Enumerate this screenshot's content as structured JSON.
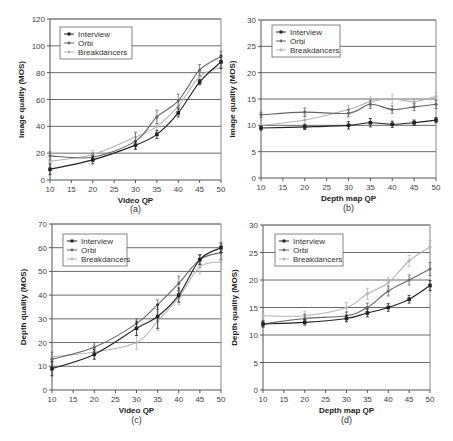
{
  "chart_data": [
    {
      "id": "a",
      "type": "line",
      "caption": "(a)",
      "xlabel": "Video QP",
      "ylabel": "Image quality (MOS)",
      "xlim": [
        10,
        50
      ],
      "ylim": [
        0,
        120
      ],
      "xticks": [
        10,
        15,
        20,
        25,
        30,
        35,
        40,
        45,
        50
      ],
      "yticks": [
        0,
        20,
        40,
        60,
        80,
        100,
        120
      ],
      "grid": "horizontal",
      "legend_position": "upper-left",
      "x": [
        10,
        20,
        30,
        35,
        40,
        45,
        50
      ],
      "series": [
        {
          "name": "Interview",
          "color": "#222222",
          "values": [
            8,
            15,
            26,
            34,
            50,
            73,
            88
          ],
          "errors": [
            4,
            3,
            3,
            3,
            3,
            2,
            5
          ]
        },
        {
          "name": "Orbi",
          "color": "#666666",
          "values": [
            18,
            17,
            29,
            47,
            59,
            82,
            92
          ],
          "errors": [
            3,
            3,
            6,
            5,
            5,
            4,
            4
          ]
        },
        {
          "name": "Breakdancers",
          "color": "#b5b5b5",
          "values": [
            14,
            19,
            32,
            40,
            55,
            77,
            84
          ],
          "errors": [
            4,
            3,
            4,
            6,
            5,
            4,
            4
          ]
        }
      ]
    },
    {
      "id": "b",
      "type": "line",
      "caption": "(b)",
      "xlabel": "Depth map QP",
      "ylabel": "Image quality (MOS)",
      "xlim": [
        10,
        50
      ],
      "ylim": [
        0,
        30
      ],
      "xticks": [
        10,
        15,
        20,
        25,
        30,
        35,
        40,
        45,
        50
      ],
      "yticks": [
        0,
        5,
        10,
        15,
        20,
        25,
        30
      ],
      "grid": "horizontal",
      "legend_position": "upper-left",
      "x": [
        10,
        20,
        30,
        35,
        40,
        45,
        50
      ],
      "series": [
        {
          "name": "Interview",
          "color": "#222222",
          "values": [
            9.5,
            9.7,
            10,
            10.5,
            10.2,
            10.5,
            11
          ],
          "errors": [
            0.4,
            0.5,
            0.7,
            0.8,
            0.6,
            0.5,
            0.5
          ]
        },
        {
          "name": "Orbi",
          "color": "#666666",
          "values": [
            12,
            12.5,
            12.3,
            14,
            13,
            13.5,
            14
          ],
          "errors": [
            0.5,
            0.8,
            0.7,
            0.8,
            0.7,
            0.7,
            0.8
          ]
        },
        {
          "name": "Breakdancers",
          "color": "#b5b5b5",
          "values": [
            10,
            11,
            13,
            14.5,
            15,
            14.5,
            15.5
          ],
          "errors": [
            0.5,
            0.8,
            0.8,
            0.9,
            0.9,
            0.6,
            0.7
          ]
        }
      ]
    },
    {
      "id": "c",
      "type": "line",
      "caption": "(c)",
      "xlabel": "Video QP",
      "ylabel": "Depth quality (MOS)",
      "xlim": [
        10,
        50
      ],
      "ylim": [
        0,
        70
      ],
      "xticks": [
        10,
        15,
        20,
        25,
        30,
        35,
        40,
        45,
        50
      ],
      "yticks": [
        0,
        10,
        20,
        30,
        40,
        50,
        60,
        70
      ],
      "grid": "horizontal",
      "legend_position": "upper-left",
      "x": [
        10,
        20,
        30,
        35,
        40,
        45,
        50
      ],
      "series": [
        {
          "name": "Interview",
          "color": "#222222",
          "values": [
            9,
            15,
            26,
            31,
            40,
            55,
            60
          ],
          "errors": [
            3,
            2,
            3,
            5,
            3,
            2,
            2
          ]
        },
        {
          "name": "Orbi",
          "color": "#666666",
          "values": [
            13,
            18,
            28,
            36,
            45,
            55,
            58
          ],
          "errors": [
            3,
            2,
            2,
            2,
            3,
            2,
            3
          ]
        },
        {
          "name": "Breakdancers",
          "color": "#b5b5b5",
          "values": [
            14,
            16,
            20,
            29,
            39,
            52,
            54
          ],
          "errors": [
            3,
            3,
            3,
            4,
            3,
            3,
            3
          ]
        }
      ]
    },
    {
      "id": "d",
      "type": "line",
      "caption": "(d)",
      "xlabel": "Depth map QP",
      "ylabel": "Depth quality (MOS)",
      "xlim": [
        10,
        50
      ],
      "ylim": [
        0,
        30
      ],
      "xticks": [
        10,
        15,
        20,
        25,
        30,
        35,
        40,
        45,
        50
      ],
      "yticks": [
        0,
        5,
        10,
        15,
        20,
        25,
        30
      ],
      "grid": "horizontal",
      "legend_position": "upper-left",
      "x": [
        10,
        20,
        30,
        35,
        40,
        45,
        50
      ],
      "series": [
        {
          "name": "Interview",
          "color": "#222222",
          "values": [
            12,
            12.3,
            13,
            14,
            15,
            16.5,
            19
          ],
          "errors": [
            0.5,
            0.5,
            0.6,
            0.7,
            0.7,
            0.7,
            0.9
          ]
        },
        {
          "name": "Orbi",
          "color": "#666666",
          "values": [
            12,
            13,
            13.5,
            15,
            18,
            20,
            22
          ],
          "errors": [
            0.6,
            0.8,
            0.7,
            0.8,
            0.9,
            0.9,
            1.2
          ]
        },
        {
          "name": "Breakdancers",
          "color": "#b5b5b5",
          "values": [
            13.5,
            13.5,
            15,
            17.5,
            19.5,
            23.5,
            26
          ],
          "errors": [
            0.5,
            0.8,
            0.9,
            1.0,
            1.0,
            1.0,
            1.2
          ]
        }
      ]
    }
  ]
}
